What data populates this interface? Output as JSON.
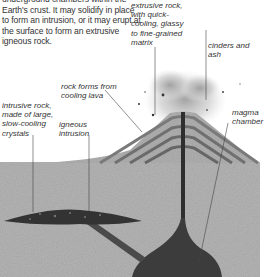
{
  "intro_text": "underground chambers within the Earth's crust. It may solidify in place to form an intrusion, or it may erupt at the surface to form an extrusive igneous rock.",
  "labels": {
    "extrusive_rock": "extrusive rock,\nwith quick-\ncooling, glassy\nto fine-grained\nmatrix",
    "cinders_ash": "cinders and ash",
    "rock_forms": "rock forms from\ncooling lava",
    "intrusive_rock": "intrusive rock,\nmade of large,\nslow-cooling\ncrystals",
    "igneous_intrusion": "igneous\nintrusion",
    "magma_chamber": "magma\nchamber"
  },
  "colors": {
    "background": "#ffffff",
    "ground": "#b4b4b4",
    "volcano_layer_light": "#a8a8a8",
    "volcano_layer_dark": "#6e6e6e",
    "magma": "#3a3a3a",
    "ash": "#c8c8c8",
    "text": "#333333"
  }
}
